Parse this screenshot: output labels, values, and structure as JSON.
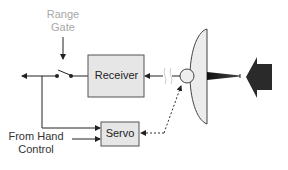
{
  "diagram": {
    "title": "",
    "type": "radar tracking block diagram",
    "labels": {
      "range_gate_line1": "Range",
      "range_gate_line2": "Gate",
      "receiver": "Receiver",
      "servo": "Servo",
      "hand_control_line1": "From Hand",
      "hand_control_line2": "Control"
    },
    "nodes": [
      {
        "id": "range-gate",
        "label": "Range Gate",
        "shape": "text"
      },
      {
        "id": "switch",
        "label": "",
        "shape": "switch"
      },
      {
        "id": "receiver",
        "label": "Receiver",
        "shape": "box"
      },
      {
        "id": "servo",
        "label": "Servo",
        "shape": "box"
      },
      {
        "id": "hand-control",
        "label": "From Hand Control",
        "shape": "text"
      },
      {
        "id": "feed",
        "label": "",
        "shape": "circle"
      },
      {
        "id": "dish",
        "label": "",
        "shape": "parabolic-dish"
      },
      {
        "id": "incoming-signal",
        "label": "",
        "shape": "block-arrow"
      }
    ],
    "edges": [
      {
        "from": "range-gate",
        "to": "switch",
        "style": "solid"
      },
      {
        "from": "receiver",
        "to": "switch",
        "style": "solid"
      },
      {
        "from": "switch",
        "to": "output-left",
        "style": "solid"
      },
      {
        "from": "switch",
        "to": "servo",
        "style": "solid"
      },
      {
        "from": "hand-control",
        "to": "servo",
        "style": "solid"
      },
      {
        "from": "feed",
        "to": "receiver",
        "style": "solid-with-break"
      },
      {
        "from": "servo",
        "to": "feed",
        "style": "dashed"
      },
      {
        "from": "incoming-signal",
        "to": "dish",
        "style": "block-arrow"
      }
    ],
    "colors": {
      "box_fill": "#e6e6e6",
      "box_stroke": "#555555",
      "line": "#222222",
      "range_gate_text": "#a8a8a8",
      "dish_fill": "#ececec",
      "arrow_fill": "#2a2a2a"
    }
  }
}
